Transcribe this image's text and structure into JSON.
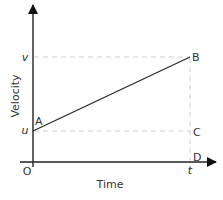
{
  "diagram": {
    "type": "velocity-time graph",
    "x_axis_label": "Time",
    "y_axis_label": "Velocity",
    "origin_label": "O",
    "y_ticks": {
      "u": "u",
      "v": "v"
    },
    "x_ticks": {
      "t": "t"
    },
    "points": {
      "A": "A",
      "B": "B",
      "C": "C",
      "D": "D"
    },
    "colors": {
      "axis": "#222222",
      "line": "#2a2a2a",
      "dashed": "#cfcfcf",
      "text": "#333333"
    }
  }
}
